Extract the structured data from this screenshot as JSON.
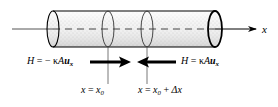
{
  "figure": {
    "name": "heat-conduction-through-cylindrical-rod-element",
    "type": "diagram",
    "background_color": "#ffffff",
    "line_color": "#000000",
    "cylinder_fill_color": "#e8e8e8",
    "width": 278,
    "height": 107
  },
  "axis": {
    "label": "x",
    "direction": "right",
    "icon": "arrow-right-icon"
  },
  "labels": {
    "flux_left": {
      "symbol": "H",
      "equals": "=",
      "sign": "−",
      "kappa": "κ",
      "area": "A",
      "gradient": "u",
      "gradient_subscript": "x",
      "full_text": "H = − κAuₓ"
    },
    "flux_right": {
      "symbol": "H",
      "equals": "=",
      "kappa": "κ",
      "area": "A",
      "gradient": "u",
      "gradient_subscript": "x",
      "full_text": "H = κAuₓ"
    },
    "position_left": {
      "variable": "x",
      "equals": "=",
      "value": "x",
      "value_subscript": "0",
      "full_text": "x = x₀"
    },
    "position_right": {
      "variable": "x",
      "equals": "=",
      "value": "x",
      "value_subscript": "0",
      "plus": "+",
      "delta": "Δx",
      "full_text": "x = x₀ + Δx"
    }
  },
  "arrows": {
    "left_flux_arrow": {
      "direction": "right",
      "icon": "bold-arrow-right-icon"
    },
    "right_flux_arrow": {
      "direction": "left",
      "icon": "bold-arrow-left-icon"
    },
    "axis_arrow": {
      "direction": "right",
      "icon": "thin-arrow-right-icon"
    }
  },
  "geometry": {
    "cylinder_left_cap_x": 53,
    "cylinder_right_cap_x": 215,
    "cylinder_top_y": 11,
    "cylinder_bottom_y": 47,
    "centerline_y": 29,
    "slice_left_x": 108,
    "slice_right_x": 147,
    "ellipse_rx": 6,
    "ellipse_ry": 18
  }
}
